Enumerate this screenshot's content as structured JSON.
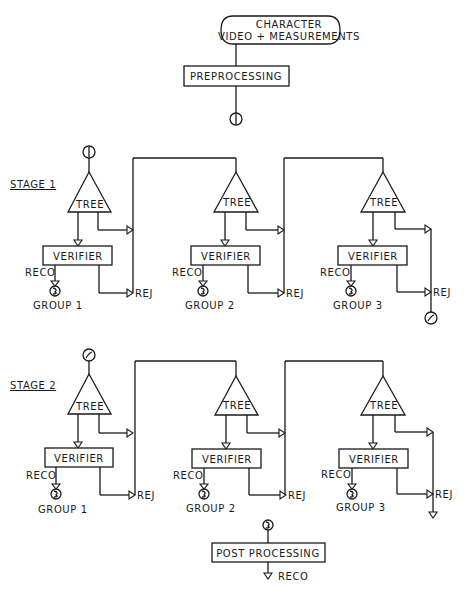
{
  "diagram": {
    "start": {
      "line1": "CHARACTER",
      "line2": "VIDEO + MEASUREMENTS"
    },
    "preprocessing": "PREPROCESSING",
    "connectors": {
      "c1": "1",
      "c2": "2",
      "c3": "3"
    },
    "stages": [
      {
        "label": "STAGE 1",
        "groups": [
          {
            "tree": "TREE",
            "verifier": "VERIFIER",
            "reco": "RECO",
            "rej": "REJ",
            "group": "GROUP 1"
          },
          {
            "tree": "TREE",
            "verifier": "VERIFIER",
            "reco": "RECO",
            "rej": "REJ",
            "group": "GROUP 2"
          },
          {
            "tree": "TREE",
            "verifier": "VERIFIER",
            "reco": "RECO",
            "rej": "REJ",
            "group": "GROUP 3"
          }
        ]
      },
      {
        "label": "STAGE 2",
        "groups": [
          {
            "tree": "TREE",
            "verifier": "VERIFIER",
            "reco": "RECO",
            "rej": "REJ",
            "group": "GROUP 1"
          },
          {
            "tree": "TREE",
            "verifier": "VERIFIER",
            "reco": "RECO",
            "rej": "REJ",
            "group": "GROUP 2"
          },
          {
            "tree": "TREE",
            "verifier": "VERIFIER",
            "reco": "RECO",
            "rej": "REJ",
            "group": "GROUP 3"
          }
        ]
      }
    ],
    "post_processing": "POST PROCESSING",
    "final_output": "RECO"
  }
}
